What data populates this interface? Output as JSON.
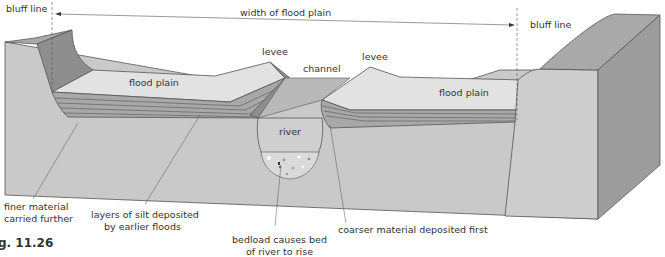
{
  "figure": {
    "caption": "g. 11.26",
    "colors": {
      "block_front": "#c9c9c9",
      "block_top": "#a9a9a9",
      "block_side": "#9d9d9d",
      "bluff_slope": "#8e8e8e",
      "flood_plain": "#e2e2e2",
      "silt_layers": "#a8a8a8",
      "channel_water": "#b9b9b9",
      "river": "#cfcfcf",
      "bedload": "#dadada",
      "line": "#555555"
    }
  },
  "labels": {
    "bluff_left": "bluff line",
    "bluff_right": "bluff line",
    "width": "width of flood plain",
    "levee_left": "levee",
    "levee_right": "levee",
    "channel": "channel",
    "flood_plain_left": "flood plain",
    "flood_plain_right": "flood plain",
    "river": "river",
    "finer_1": "finer material",
    "finer_2": "carried further",
    "silt_1": "layers of silt deposited",
    "silt_2": "by earlier floods",
    "bedload_1": "bedload causes bed",
    "bedload_2": "of river to rise",
    "coarser": "coarser material deposited first"
  }
}
